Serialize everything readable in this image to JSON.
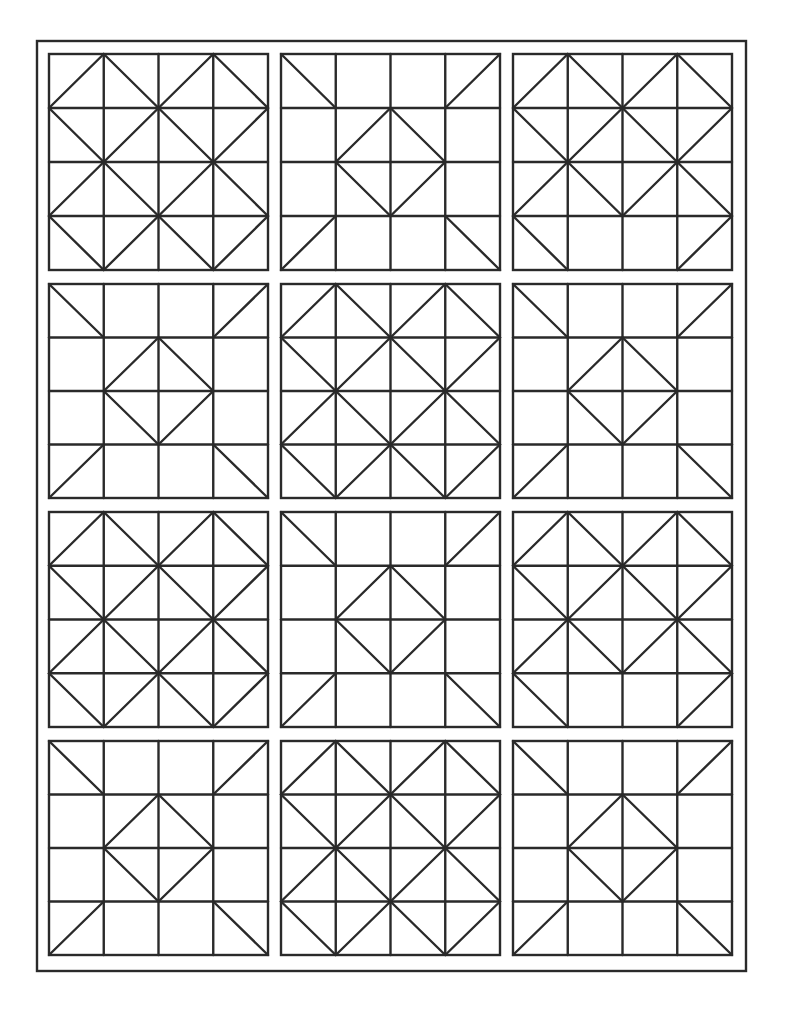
{
  "page": {
    "width": 786,
    "height": 1017,
    "background": "#ffffff",
    "line_color": "#2a2a2a",
    "line_width": 2.4
  },
  "frame": {
    "x1": 37,
    "y1": 41,
    "x2": 746,
    "y2": 971
  },
  "grid": {
    "columns": [
      {
        "x1": 49,
        "x2": 268
      },
      {
        "x1": 281,
        "x2": 500
      },
      {
        "x1": 513,
        "x2": 732
      }
    ],
    "rows": [
      {
        "y1": 54,
        "y2": 270
      },
      {
        "y1": 284,
        "y2": 498
      },
      {
        "y1": 512,
        "y2": 727
      },
      {
        "y1": 741,
        "y2": 955
      }
    ]
  },
  "block_types": {
    "A": {
      "name": "big-diamond-block",
      "description": "4x4 grid, large center diamond, triangles on all sides"
    },
    "B": {
      "name": "small-diamond-block",
      "description": "4x4 grid, small center diamond, corner diagonals"
    },
    "C": {
      "name": "big-diamond-open-bottom-block",
      "description": "4x4 grid, large center diamond, plain bottom middle"
    }
  },
  "layout": [
    [
      "A",
      "B",
      "C"
    ],
    [
      "B",
      "A",
      "B"
    ],
    [
      "A",
      "B",
      "C"
    ],
    [
      "B",
      "A",
      "B"
    ]
  ]
}
